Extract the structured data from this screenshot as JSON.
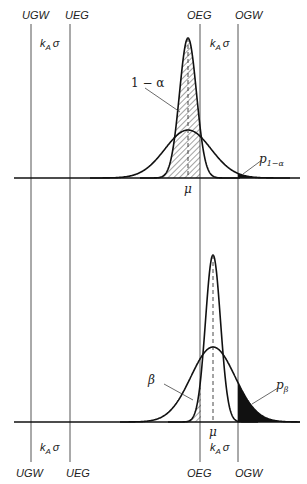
{
  "diagram": {
    "type": "tolerance-distribution-diagram",
    "limit_lines": {
      "top": [
        "UGW",
        "UEG",
        "OEG",
        "OGW"
      ],
      "bottom": [
        "UGW",
        "UEG",
        "OEG",
        "OGW"
      ]
    },
    "top_panel": {
      "k_left": "k",
      "k_left_sub": "A",
      "k_left_sigma": "σ",
      "k_right": "k",
      "k_right_sub": "A",
      "k_right_sigma": "σ",
      "one_minus_alpha": "1 − α",
      "mu": "μ",
      "p_label": "p",
      "p_sub": "1−α"
    },
    "bottom_panel": {
      "beta": "β",
      "p_label": "p",
      "p_sub": "β",
      "mu": "μ",
      "k_left": "k",
      "k_left_sub": "A",
      "k_left_sigma": "σ",
      "k_right": "k",
      "k_right_sub": "A",
      "k_right_sigma": "σ"
    }
  }
}
